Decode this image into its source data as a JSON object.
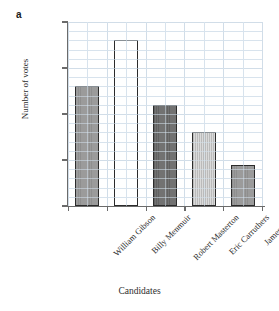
{
  "panel": {
    "letter": "a"
  },
  "chart_data": {
    "type": "bar",
    "title": "",
    "subtitle": "",
    "xlabel": "Candidates",
    "ylabel": "Number of votes",
    "categories": [
      "William Gibson",
      "Billy Menmuir",
      "Robert Masterton",
      "Eric Carruthers",
      "James Cant"
    ],
    "values": [
      26,
      36,
      22,
      16,
      9
    ],
    "ylim": [
      0,
      40
    ],
    "yticks": [
      0,
      10,
      20,
      30,
      40
    ],
    "ytick_labels": [
      "0",
      "10",
      "20",
      "30",
      "40"
    ],
    "y_minor_step": 2,
    "grid": true,
    "grid_color": "#d9e2ea",
    "legend": "none",
    "bar_styles": [
      {
        "fill": "medium-gray",
        "color": "#828282",
        "edge": "#2b2b2b"
      },
      {
        "fill": "white",
        "color": "#ffffff",
        "edge": "#2b2b2b"
      },
      {
        "fill": "dark-gray",
        "color": "#5f5f5f",
        "edge": "#2b2b2b"
      },
      {
        "fill": "light-gray-striped",
        "color": "#d0d0d0",
        "edge": "#2b2b2b"
      },
      {
        "fill": "medium-gray",
        "color": "#9a9a9a",
        "edge": "#2b2b2b"
      }
    ]
  }
}
